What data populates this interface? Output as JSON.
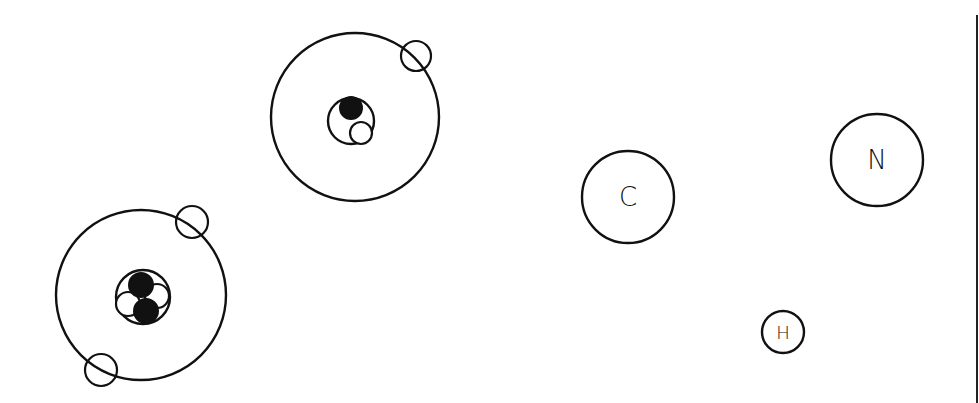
{
  "diagram": {
    "colors": {
      "line": "#111111",
      "background": "#ffffff",
      "proton_fill": "#111111",
      "neutron_fill": "#ffffff"
    },
    "atoms": [
      {
        "name": "deuterium-atom",
        "orbit": {
          "cx": 355,
          "cy": 117,
          "r": 84
        },
        "nucleus": {
          "cx": 351,
          "cy": 121,
          "r": 23
        },
        "protons": [
          {
            "cx": 351,
            "cy": 108,
            "r": 11
          }
        ],
        "neutrons": [
          {
            "cx": 361,
            "cy": 133,
            "r": 11
          }
        ],
        "electrons": [
          {
            "cx": 416,
            "cy": 56,
            "r": 15
          }
        ]
      },
      {
        "name": "helium-atom",
        "orbit": {
          "cx": 141,
          "cy": 295,
          "r": 85
        },
        "nucleus": {
          "cx": 143,
          "cy": 297,
          "r": 27
        },
        "protons": [
          {
            "cx": 141,
            "cy": 285,
            "r": 12
          },
          {
            "cx": 146,
            "cy": 311,
            "r": 12
          }
        ],
        "neutrons": [
          {
            "cx": 128,
            "cy": 304,
            "r": 12
          },
          {
            "cx": 157,
            "cy": 296,
            "r": 12
          }
        ],
        "electrons": [
          {
            "cx": 192,
            "cy": 222,
            "r": 16
          },
          {
            "cx": 101,
            "cy": 370,
            "r": 16
          }
        ]
      }
    ],
    "elements": [
      {
        "symbol": "C",
        "cx": 628,
        "cy": 197,
        "r": 46,
        "font_size": 26
      },
      {
        "symbol": "N",
        "cx": 877,
        "cy": 160,
        "r": 46,
        "font_size": 26
      },
      {
        "symbol": "H",
        "cx": 783,
        "cy": 332,
        "r": 21,
        "font_size": 18
      }
    ],
    "border_line": {
      "x": 977,
      "y1": 15,
      "y2": 403
    }
  }
}
